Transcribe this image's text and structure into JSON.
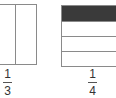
{
  "figures": [
    {
      "id": "left",
      "total_parts": 3,
      "shaded_parts": 0,
      "orientation": "vertical",
      "label": {
        "numerator": "1",
        "denominator": "3"
      }
    },
    {
      "id": "right",
      "total_parts": 4,
      "shaded_parts": 1,
      "orientation": "horizontal",
      "shade_color": "#3a3a3a",
      "label": {
        "numerator": "1",
        "denominator": "4"
      }
    }
  ]
}
